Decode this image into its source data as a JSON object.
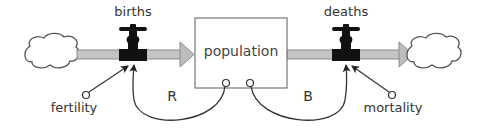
{
  "diagram": {
    "type": "stock-and-flow",
    "stock": {
      "label": "population"
    },
    "flows": [
      {
        "id": "births",
        "label": "births",
        "direction": "inflow"
      },
      {
        "id": "deaths",
        "label": "deaths",
        "direction": "outflow"
      }
    ],
    "auxiliaries": [
      {
        "id": "fertility",
        "label": "fertility",
        "affects": "births"
      },
      {
        "id": "mortality",
        "label": "mortality",
        "affects": "deaths"
      }
    ],
    "loops": [
      {
        "label": "R",
        "type": "reinforcing",
        "from": "population",
        "to": "births"
      },
      {
        "label": "B",
        "type": "balancing",
        "from": "population",
        "to": "deaths"
      }
    ],
    "sources_sinks": [
      "cloud-source",
      "cloud-sink"
    ],
    "colors": {
      "pipe": "#c4c4c4",
      "pipe_border": "#8a8a8a",
      "valve": "#111111",
      "line": "#333333"
    }
  }
}
